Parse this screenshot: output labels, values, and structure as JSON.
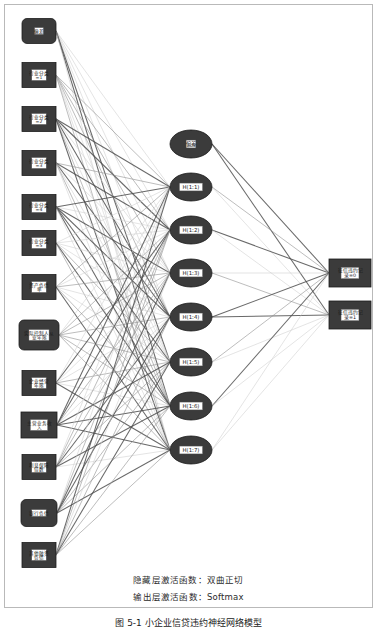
{
  "figure": {
    "caption": "图 5-1  小企业信贷违约神经网络模型",
    "hidden_activation_note": "隐藏层激活函数：双曲正切",
    "output_activation_note": "输出层激活函数：Softmax"
  },
  "colors": {
    "node_fill": "#3b3b3b",
    "node_stroke": "#1c1c1c",
    "label_box_fill": "#ffffff",
    "label_text": "#1a1a1a",
    "edge_dark": "#4f4f4f",
    "edge_light": "#cfcfcf",
    "frame_border": "#b9b9b9",
    "background": "#ffffff"
  },
  "layers": {
    "input": {
      "name": "输入层",
      "nodes": [
        {
          "id": "in-bias",
          "label": "偏差",
          "shape": "rounded",
          "cx": 34,
          "cy": 26,
          "w": 34,
          "h": 25
        },
        {
          "id": "in-ind1",
          "label": "行业分类\n=1",
          "label_line1": "行业分类",
          "label_line2": "=1",
          "shape": "rect",
          "cx": 34,
          "cy": 70,
          "w": 34,
          "h": 25
        },
        {
          "id": "in-ind2",
          "label": "行业分类\n=2",
          "label_line1": "行业分类",
          "label_line2": "=2",
          "shape": "rect",
          "cx": 34,
          "cy": 114,
          "w": 34,
          "h": 25
        },
        {
          "id": "in-ind3",
          "label": "行业分类\n=3",
          "label_line1": "行业分类",
          "label_line2": "=3",
          "shape": "rect",
          "cx": 34,
          "cy": 158,
          "w": 34,
          "h": 25
        },
        {
          "id": "in-ind4",
          "label": "行业分类\n=4",
          "label_line1": "行业分类",
          "label_line2": "=4",
          "shape": "rect",
          "cx": 34,
          "cy": 202,
          "w": 34,
          "h": 25
        },
        {
          "id": "in-ind5",
          "label": "行业分类\n=5",
          "label_line1": "行业分类",
          "label_line2": "=5",
          "shape": "rect",
          "cx": 34,
          "cy": 238,
          "w": 34,
          "h": 25
        },
        {
          "id": "in-debt-ratio",
          "label": "资产负债率",
          "label_line1": "资产负债",
          "label_line2": "率",
          "shape": "rect",
          "cx": 34,
          "cy": 282,
          "w": 34,
          "h": 25
        },
        {
          "id": "in-controller-years",
          "label": "实际控制人从业年限",
          "label_line1": "实际控制人从",
          "label_line2": "业年限",
          "shape": "rounded",
          "cx": 34,
          "cy": 330,
          "w": 40,
          "h": 30
        },
        {
          "id": "in-firm-years",
          "label": "企业经营年限",
          "label_line1": "企业经营",
          "label_line2": "年限",
          "shape": "rect",
          "cx": 34,
          "cy": 378,
          "w": 34,
          "h": 25
        },
        {
          "id": "in-main-revenue",
          "label": "主营业务收入",
          "label_line1": "主营业务收",
          "label_line2": "入",
          "shape": "rect",
          "cx": 34,
          "cy": 420,
          "w": 36,
          "h": 26
        },
        {
          "id": "in-interest-cover",
          "label": "利息保障倍数",
          "label_line1": "利息保障",
          "label_line2": "倍数",
          "shape": "rect",
          "cx": 34,
          "cy": 462,
          "w": 34,
          "h": 25
        },
        {
          "id": "in-bank-debt",
          "label": "银行负债",
          "label_line1": "银行负债",
          "label_line2": "",
          "shape": "rounded",
          "cx": 34,
          "cy": 508,
          "w": 36,
          "h": 27
        },
        {
          "id": "in-other-debt",
          "label": "其他融资负债",
          "label_line1": "其他融资",
          "label_line2": "负债",
          "shape": "rect",
          "cx": 34,
          "cy": 550,
          "w": 34,
          "h": 25
        }
      ]
    },
    "hidden": {
      "name": "隐藏层",
      "nodes": [
        {
          "id": "h-bias",
          "label": "偏差",
          "shape": "ellipse",
          "cx": 186,
          "cy": 139,
          "rx": 21,
          "ry": 14
        },
        {
          "id": "h-1",
          "label": "H(1:1)",
          "shape": "ellipse",
          "cx": 186,
          "cy": 182,
          "rx": 21,
          "ry": 14
        },
        {
          "id": "h-2",
          "label": "H(1:2)",
          "shape": "ellipse",
          "cx": 186,
          "cy": 225,
          "rx": 21,
          "ry": 14
        },
        {
          "id": "h-3",
          "label": "H(1:3)",
          "shape": "ellipse",
          "cx": 186,
          "cy": 268,
          "rx": 21,
          "ry": 14
        },
        {
          "id": "h-4",
          "label": "H(1:4)",
          "shape": "ellipse",
          "cx": 186,
          "cy": 312,
          "rx": 21,
          "ry": 14
        },
        {
          "id": "h-5",
          "label": "H(1:5)",
          "shape": "ellipse",
          "cx": 186,
          "cy": 357,
          "rx": 21,
          "ry": 14
        },
        {
          "id": "h-6",
          "label": "H(1:6)",
          "shape": "ellipse",
          "cx": 186,
          "cy": 401,
          "rx": 21,
          "ry": 14
        },
        {
          "id": "h-7",
          "label": "H(1:7)",
          "shape": "ellipse",
          "cx": 186,
          "cy": 445,
          "rx": 21,
          "ry": 14
        }
      ]
    },
    "output": {
      "name": "输出层",
      "nodes": [
        {
          "id": "out-0",
          "label": "征信违约记录=0",
          "label_line1": "征信违约记",
          "label_line2": "录=0",
          "shape": "rect",
          "cx": 345,
          "cy": 268,
          "w": 42,
          "h": 28
        },
        {
          "id": "out-1",
          "label": "征信违约记录=1",
          "label_line1": "征信违约记",
          "label_line2": "录=1",
          "shape": "rect",
          "cx": 345,
          "cy": 310,
          "w": 42,
          "h": 28
        }
      ]
    }
  }
}
